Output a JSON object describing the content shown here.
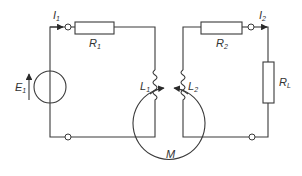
{
  "diagram": {
    "type": "coupled-inductor circuit",
    "labels": {
      "I1": {
        "main": "I",
        "sub": "1"
      },
      "R1": {
        "main": "R",
        "sub": "1"
      },
      "E1": {
        "main": "E",
        "sub": "1"
      },
      "L1": {
        "main": "L",
        "sub": "1"
      },
      "L2": {
        "main": "L",
        "sub": "2"
      },
      "R2": {
        "main": "R",
        "sub": "2"
      },
      "I2": {
        "main": "I",
        "sub": "2"
      },
      "RL": {
        "main": "R",
        "sub": "L"
      },
      "M": {
        "main": "M"
      }
    },
    "colors": {
      "line": "#3a3a3a",
      "background": "#ffffff"
    }
  }
}
